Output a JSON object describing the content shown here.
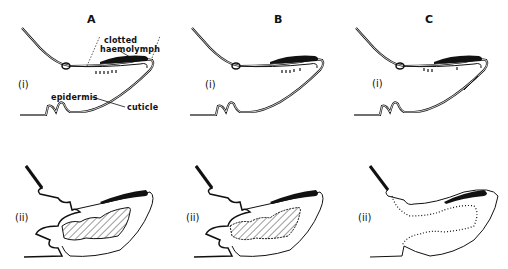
{
  "figure": {
    "columns": [
      {
        "id": "A",
        "label": "A"
      },
      {
        "id": "B",
        "label": "B"
      },
      {
        "id": "C",
        "label": "C"
      }
    ],
    "rows": [
      {
        "id": "i",
        "label": "(i)"
      },
      {
        "id": "ii",
        "label": "(ii)"
      }
    ],
    "annotations": {
      "clotted_haemolymph": "clotted\nhaemolymph",
      "clotted": "clotted",
      "haemolymph": "haemolymph",
      "epidermis": "epidermis",
      "cuticle": "cuticle"
    },
    "colors": {
      "ink": "#111111",
      "background": "#ffffff"
    }
  }
}
